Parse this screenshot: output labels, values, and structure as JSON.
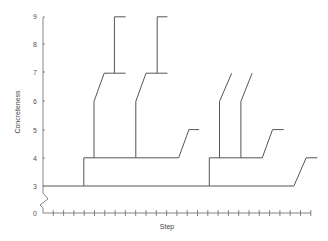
{
  "chart_data": {
    "type": "line",
    "subtype": "branching-step-tree",
    "title": "",
    "xlabel": "Step",
    "ylabel": "Concreteness",
    "yticks": [
      0,
      3,
      4,
      5,
      6,
      7,
      8,
      9
    ],
    "ylim": [
      0,
      9
    ],
    "y_axis_break": "between 0 and 3",
    "x_tick_count": 26,
    "x_tick_labels": [],
    "grid": false,
    "legend": null,
    "colors": {
      "line": "#555555",
      "axis": "#666666",
      "text": "#555555"
    },
    "segments": [
      {
        "name": "trunk",
        "points": [
          [
            0,
            3
          ],
          [
            24.6,
            3
          ],
          [
            25.8,
            4
          ],
          [
            26.9,
            4
          ]
        ]
      },
      {
        "name": "subtree-1-stem",
        "points": [
          [
            4,
            3
          ],
          [
            4,
            4
          ],
          [
            13.3,
            4
          ],
          [
            14.3,
            5
          ],
          [
            15.3,
            5
          ]
        ]
      },
      {
        "name": "subtree-1-branch-a",
        "points": [
          [
            5,
            4
          ],
          [
            5,
            6
          ],
          [
            6,
            7
          ],
          [
            8.1,
            7
          ]
        ]
      },
      {
        "name": "subtree-1-branch-a-top",
        "points": [
          [
            7,
            7
          ],
          [
            7,
            9
          ],
          [
            8.1,
            9
          ]
        ]
      },
      {
        "name": "subtree-1-branch-b",
        "points": [
          [
            9.1,
            4
          ],
          [
            9.1,
            6
          ],
          [
            10.1,
            7
          ],
          [
            12.2,
            7
          ]
        ]
      },
      {
        "name": "subtree-1-branch-b-top",
        "points": [
          [
            11.2,
            7
          ],
          [
            11.2,
            9
          ],
          [
            12.2,
            9
          ]
        ]
      },
      {
        "name": "subtree-2-stem",
        "points": [
          [
            16.3,
            3
          ],
          [
            16.3,
            4
          ],
          [
            21.5,
            4
          ],
          [
            22.5,
            5
          ],
          [
            23.6,
            5
          ]
        ]
      },
      {
        "name": "subtree-2-branch-a",
        "points": [
          [
            17.3,
            4
          ],
          [
            17.3,
            6
          ],
          [
            18.5,
            7
          ]
        ]
      },
      {
        "name": "subtree-2-branch-b",
        "points": [
          [
            19.4,
            4
          ],
          [
            19.4,
            6
          ],
          [
            20.5,
            7
          ]
        ]
      }
    ]
  }
}
